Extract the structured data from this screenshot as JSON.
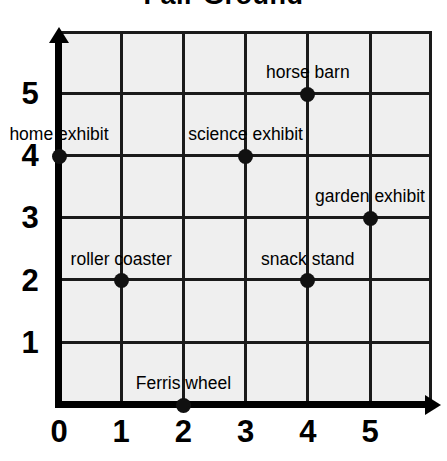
{
  "title": "Fair Ground",
  "chart_data": {
    "type": "scatter",
    "title": "Fair Ground",
    "xlabel": "",
    "ylabel": "",
    "xlim": [
      0,
      6
    ],
    "ylim": [
      0,
      6
    ],
    "grid": true,
    "legend": "none",
    "x_ticks": [
      "0",
      "1",
      "2",
      "3",
      "4",
      "5"
    ],
    "y_ticks": [
      "1",
      "2",
      "3",
      "4",
      "5"
    ],
    "points": [
      {
        "label": "home exhibit",
        "x": 0,
        "y": 4
      },
      {
        "label": "roller coaster",
        "x": 1,
        "y": 2
      },
      {
        "label": "Ferris wheel",
        "x": 2,
        "y": 0
      },
      {
        "label": "science exhibit",
        "x": 3,
        "y": 4
      },
      {
        "label": "horse barn",
        "x": 4,
        "y": 5
      },
      {
        "label": "snack stand",
        "x": 4,
        "y": 2
      },
      {
        "label": "garden exhibit",
        "x": 5,
        "y": 3
      }
    ]
  },
  "colors": {
    "point": "#111111",
    "axis": "#000000",
    "grid_line": "#1a1a1a",
    "cell_fill": "#efefef",
    "background": "#ffffff"
  }
}
